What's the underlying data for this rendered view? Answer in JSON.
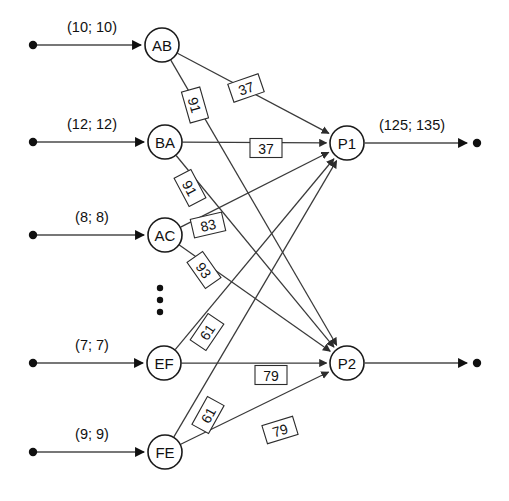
{
  "diagram": {
    "type": "directed-graph",
    "colors": {
      "background": "#ffffff",
      "node_stroke": "#1a1a1a",
      "node_fill": "#ffffff",
      "edge": "#3a3a3a",
      "io_edge": "#4a4a4a",
      "text": "#111111",
      "label_box_stroke": "#2c2c2c"
    },
    "source_nodes": [
      {
        "id": "AB",
        "label": "AB",
        "cx": 162,
        "cy": 45
      },
      {
        "id": "BA",
        "label": "BA",
        "cx": 165,
        "cy": 142
      },
      {
        "id": "AC",
        "label": "AC",
        "cx": 165,
        "cy": 235
      },
      {
        "id": "EF",
        "label": "EF",
        "cx": 164,
        "cy": 363
      },
      {
        "id": "FE",
        "label": "FE",
        "cx": 165,
        "cy": 452
      }
    ],
    "sink_nodes": [
      {
        "id": "P1",
        "label": "P1",
        "cx": 347,
        "cy": 143
      },
      {
        "id": "P2",
        "label": "P2",
        "cx": 347,
        "cy": 363
      }
    ],
    "node_radius": 17,
    "inputs": [
      {
        "target": "AB",
        "label": "(10; 10)",
        "dot_x": 33,
        "y": 45,
        "label_x": 92,
        "label_y": 32
      },
      {
        "target": "BA",
        "label": "(12; 12)",
        "dot_x": 33,
        "y": 142,
        "label_x": 92,
        "label_y": 129
      },
      {
        "target": "AC",
        "label": "(8; 8)",
        "dot_x": 33,
        "y": 235,
        "label_x": 92,
        "label_y": 222
      },
      {
        "target": "EF",
        "label": "(7; 7)",
        "dot_x": 33,
        "y": 363,
        "label_x": 92,
        "label_y": 350
      },
      {
        "target": "FE",
        "label": "(9; 9)",
        "dot_x": 33,
        "y": 452,
        "label_x": 92,
        "label_y": 439
      }
    ],
    "outputs": [
      {
        "source": "P1",
        "label": "(125; 135)",
        "dot_x": 477,
        "y": 143,
        "label_x": 412,
        "label_y": 130
      },
      {
        "source": "P2",
        "label": "",
        "dot_x": 477,
        "y": 363,
        "label_x": 412,
        "label_y": 350
      }
    ],
    "ellipsis": {
      "x": 160,
      "ys": [
        288,
        300,
        312
      ]
    },
    "edges": [
      {
        "from": "AB",
        "to": "P1",
        "weight": "37",
        "lx": 246,
        "ly": 88,
        "rot": -19
      },
      {
        "from": "AB",
        "to": "P2",
        "weight": "91",
        "lx": 195,
        "ly": 105,
        "rot": 74
      },
      {
        "from": "BA",
        "to": "P1",
        "weight": "37",
        "lx": 266,
        "ly": 148,
        "rot": 0
      },
      {
        "from": "BA",
        "to": "P2",
        "weight": "91",
        "lx": 190,
        "ly": 188,
        "rot": 62
      },
      {
        "from": "AC",
        "to": "P1",
        "weight": "83",
        "lx": 208,
        "ly": 225,
        "rot": -13
      },
      {
        "from": "AC",
        "to": "P2",
        "weight": "93",
        "lx": 204,
        "ly": 270,
        "rot": 55
      },
      {
        "from": "EF",
        "to": "P1",
        "weight": "61",
        "lx": 207,
        "ly": 332,
        "rot": -56
      },
      {
        "from": "EF",
        "to": "P2",
        "weight": "79",
        "lx": 271,
        "ly": 375,
        "rot": 0
      },
      {
        "from": "FE",
        "to": "P1",
        "weight": "61",
        "lx": 208,
        "ly": 415,
        "rot": -61
      },
      {
        "from": "FE",
        "to": "P2",
        "weight": "79",
        "lx": 280,
        "ly": 430,
        "rot": -17
      }
    ]
  }
}
